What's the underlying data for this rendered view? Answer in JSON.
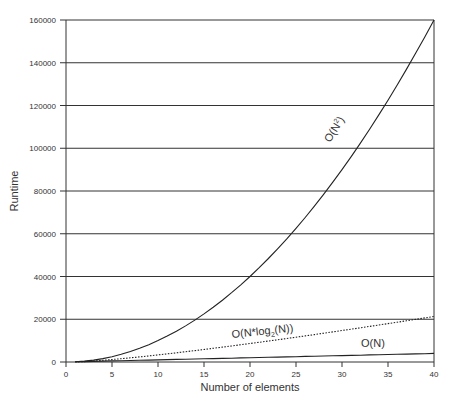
{
  "chart_data": {
    "type": "line",
    "title": "",
    "xlabel": "Number of elements",
    "ylabel": "Runtime",
    "xlim": [
      0,
      40
    ],
    "ylim": [
      0,
      160000
    ],
    "x_ticks": [
      0,
      5,
      10,
      15,
      20,
      25,
      30,
      35,
      40
    ],
    "y_ticks": [
      0,
      20000,
      40000,
      60000,
      80000,
      100000,
      120000,
      140000,
      160000
    ],
    "grid": "horizontal",
    "legend": "inline labels",
    "x": [
      1,
      2,
      3,
      4,
      5,
      6,
      7,
      8,
      9,
      10,
      11,
      12,
      13,
      14,
      15,
      16,
      17,
      18,
      19,
      20,
      21,
      22,
      23,
      24,
      25,
      26,
      27,
      28,
      29,
      30,
      31,
      32,
      33,
      34,
      35,
      36,
      37,
      38,
      39,
      40
    ],
    "series": [
      {
        "name": "O(N²)",
        "label": "O(N²)",
        "style": "solid",
        "formula": "100*N^2",
        "values": [
          100,
          400,
          900,
          1600,
          2500,
          3600,
          4900,
          6400,
          8100,
          10000,
          12100,
          14400,
          16900,
          19600,
          22500,
          25600,
          28900,
          32400,
          36100,
          40000,
          44100,
          48400,
          52900,
          57600,
          62500,
          67600,
          72900,
          78400,
          84100,
          90000,
          96100,
          102400,
          108900,
          115600,
          122500,
          129600,
          136900,
          144400,
          152100,
          160000
        ]
      },
      {
        "name": "O(N*log2(N))",
        "label": "O(N*log2(N))",
        "style": "dotted",
        "formula": "100*N*log2(N)",
        "values": [
          0,
          200,
          475,
          800,
          1161,
          1551,
          1965,
          2400,
          2853,
          3322,
          3805,
          4302,
          4811,
          5330,
          5860,
          6400,
          6949,
          7506,
          8071,
          8644,
          9224,
          9811,
          10404,
          11004,
          11610,
          12221,
          12838,
          13460,
          14088,
          14721,
          15358,
          16000,
          16647,
          17298,
          17953,
          18612,
          19275,
          19942,
          20613,
          21288
        ]
      },
      {
        "name": "O(N)",
        "label": "O(N)",
        "style": "solid",
        "formula": "100*N",
        "values": [
          100,
          200,
          300,
          400,
          500,
          600,
          700,
          800,
          900,
          1000,
          1100,
          1200,
          1300,
          1400,
          1500,
          1600,
          1700,
          1800,
          1900,
          2000,
          2100,
          2200,
          2300,
          2400,
          2500,
          2600,
          2700,
          2800,
          2900,
          3000,
          3100,
          3200,
          3300,
          3400,
          3500,
          3600,
          3700,
          3800,
          3900,
          4000
        ]
      }
    ],
    "annotations": [
      {
        "text": "O(N²)",
        "near_x": 33,
        "near_y": 110000,
        "rotated": true
      },
      {
        "text": "O(N*log2(N))",
        "near_x": 25,
        "near_y": 25000
      },
      {
        "text": "O(N)",
        "near_x": 35,
        "near_y": 8000
      }
    ]
  },
  "labels": {
    "xlabel": "Number of elements",
    "ylabel": "Runtime",
    "n2_prefix": "O(N",
    "n2_sup": "2",
    "n2_suffix": ")",
    "nlog_prefix": "O(N*log",
    "nlog_sub": "2",
    "nlog_suffix": "(N))",
    "n_label": "O(N)"
  }
}
